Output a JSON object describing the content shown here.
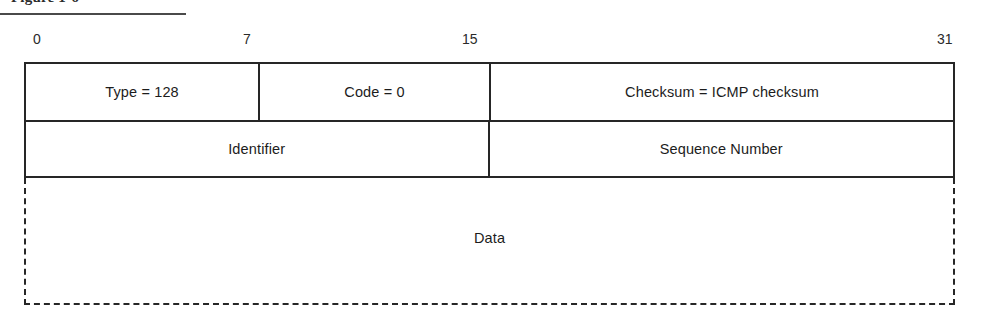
{
  "figure": {
    "caption": "Figure 1-6"
  },
  "bit_ruler": {
    "ticks": [
      {
        "label": "0",
        "x": 33
      },
      {
        "label": "7",
        "x": 243
      },
      {
        "label": "15",
        "x": 462
      },
      {
        "label": "31",
        "x": 937
      }
    ]
  },
  "packet": {
    "rows": [
      {
        "name": "header-row-1",
        "cells": [
          {
            "name": "type-field",
            "label": "Type = 128"
          },
          {
            "name": "code-field",
            "label": "Code = 0"
          },
          {
            "name": "checksum-field",
            "label": "Checksum = ICMP checksum"
          }
        ]
      },
      {
        "name": "header-row-2",
        "cells": [
          {
            "name": "identifier-field",
            "label": "Identifier"
          },
          {
            "name": "sequence-number-field",
            "label": "Sequence Number"
          }
        ]
      }
    ],
    "data_region": {
      "name": "data-field",
      "label": "Data"
    }
  },
  "colors": {
    "line": "#262626",
    "text": "#1c1c1c",
    "background": "#ffffff"
  }
}
